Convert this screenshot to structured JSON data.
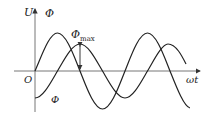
{
  "diagram": {
    "title": "",
    "axes": {
      "y_label_1": "U",
      "y_label_2": "Φ",
      "x_label": "ωt",
      "origin_label": "O"
    },
    "curves": [
      {
        "name": "U",
        "shape": "sine",
        "amplitude_px": 38,
        "phase": "starts at origin rising"
      },
      {
        "name": "Φ",
        "shape": "negative cosine",
        "amplitude_px": 27,
        "phase": "lags U by 90°"
      }
    ],
    "annotations": {
      "phi_max": "Φ",
      "phi_max_sub": "max",
      "phi_curve_label": "Φ"
    },
    "colors": {
      "line": "#222222",
      "axis": "#555555",
      "background": "#ffffff"
    }
  }
}
